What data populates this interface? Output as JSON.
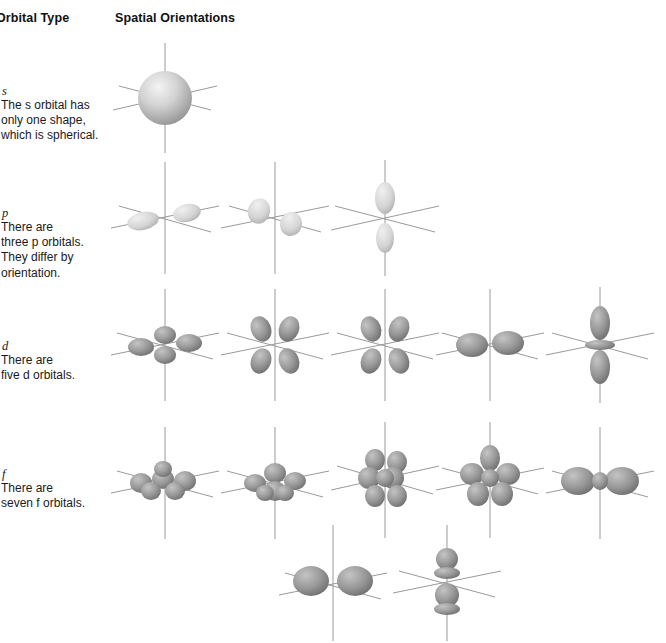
{
  "headers": {
    "orbital_type": "Orbital Type",
    "spatial_orientations": "Spatial Orientations"
  },
  "orbital_types": [
    {
      "symbol": "s",
      "description_line1": "The s orbital has",
      "description_line2": "only one shape,",
      "description_line3": "which is spherical.",
      "count": 1
    },
    {
      "symbol": "p",
      "description_line1": "There are",
      "description_line2": "three p orbitals.",
      "description_line3": "They differ by",
      "description_line4": "orientation.",
      "count": 3
    },
    {
      "symbol": "d",
      "description_line1": "There are",
      "description_line2": "five d orbitals.",
      "count": 5
    },
    {
      "symbol": "f",
      "description_line1": "There are",
      "description_line2": "seven f orbitals.",
      "count": 7
    }
  ],
  "colors": {
    "background": "#ffffff",
    "text": "#1a1a1a",
    "header_text": "#111111",
    "axis_line": "#9a9a9a",
    "lobe_light": "#d8d8d8",
    "lobe_mid": "#a8a8a8",
    "lobe_dark": "#707070",
    "sphere_light": "#eeeeee",
    "sphere_dark": "#9a9a9a"
  },
  "diagrams": {
    "s_row": [
      {
        "name": "s-orbital",
        "shape": "sphere"
      }
    ],
    "p_row": [
      {
        "name": "p-orbital-x",
        "shape": "dumbbell-x"
      },
      {
        "name": "p-orbital-y",
        "shape": "dumbbell-y"
      },
      {
        "name": "p-orbital-z",
        "shape": "dumbbell-z"
      }
    ],
    "d_row": [
      {
        "name": "d-orbital-1",
        "shape": "cloverleaf-flat"
      },
      {
        "name": "d-orbital-2",
        "shape": "cloverleaf-upright"
      },
      {
        "name": "d-orbital-3",
        "shape": "cloverleaf-upright"
      },
      {
        "name": "d-orbital-4",
        "shape": "dumbbell-wide"
      },
      {
        "name": "d-orbital-5",
        "shape": "dz2-torus"
      }
    ],
    "f_row_top": [
      {
        "name": "f-orbital-1",
        "shape": "multilobe-flat"
      },
      {
        "name": "f-orbital-2",
        "shape": "multilobe-flat"
      },
      {
        "name": "f-orbital-3",
        "shape": "multilobe-complex"
      },
      {
        "name": "f-orbital-4",
        "shape": "multilobe-upright"
      },
      {
        "name": "f-orbital-5",
        "shape": "multilobe-wide"
      }
    ],
    "f_row_bottom": [
      {
        "name": "f-orbital-6",
        "shape": "multilobe-wide"
      },
      {
        "name": "f-orbital-7",
        "shape": "fz3-stacked"
      }
    ]
  }
}
